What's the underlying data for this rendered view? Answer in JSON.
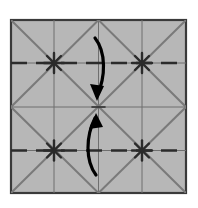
{
  "diagram": {
    "type": "origami-folding-instruction",
    "canvas": {
      "width": 198,
      "height": 208,
      "background_color": "#ffffff"
    },
    "paper": {
      "label": "square paper sheet",
      "fill_color": "#b7b7b7",
      "border_color": "#3a3a3a",
      "border_width": 2.2,
      "left": 11,
      "top": 20,
      "right": 186,
      "bottom": 193,
      "width": 175,
      "height": 173
    },
    "grid": {
      "label": "quarter grid lines",
      "color": "#6f6f6f",
      "width": 1,
      "vertical_x": [
        54,
        98.5,
        142
      ],
      "horizontal_y": [
        63,
        107,
        150.5
      ]
    },
    "creases": {
      "label": "diagonal crease lines",
      "color": "#7a7a7a",
      "width": 2,
      "segments": [
        {
          "name": "diag-tl-br-full",
          "x1": 11,
          "y1": 20,
          "x2": 186,
          "y2": 193
        },
        {
          "name": "diag-tr-bl-full",
          "x1": 186,
          "y1": 20,
          "x2": 11,
          "y2": 193
        },
        {
          "name": "diag-top-mid-left",
          "x1": 98.5,
          "y1": 20,
          "x2": 11,
          "y2": 107
        },
        {
          "name": "diag-top-mid-right",
          "x1": 98.5,
          "y1": 20,
          "x2": 186,
          "y2": 107
        },
        {
          "name": "diag-bottom-mid-left",
          "x1": 98.5,
          "y1": 193,
          "x2": 11,
          "y2": 107
        },
        {
          "name": "diag-bottom-mid-right",
          "x1": 98.5,
          "y1": 193,
          "x2": 186,
          "y2": 107
        }
      ]
    },
    "fold_lines": {
      "label": "valley fold dashed lines",
      "color": "#2b2b2b",
      "width": 2.6,
      "dash_pattern": "16 9",
      "lines": [
        {
          "name": "upper-fold-line",
          "y": 63,
          "x1": 11,
          "x2": 186
        },
        {
          "name": "lower-fold-line",
          "y": 150.5,
          "x1": 11,
          "x2": 186
        }
      ]
    },
    "stars": {
      "label": "crease intersection star points",
      "color": "#2b2b2b",
      "points": [
        {
          "name": "star-upper-left",
          "x": 54,
          "y": 63
        },
        {
          "name": "star-upper-right",
          "x": 142,
          "y": 63
        },
        {
          "name": "star-lower-left",
          "x": 54,
          "y": 150.5
        },
        {
          "name": "star-lower-right",
          "x": 142,
          "y": 150.5
        }
      ]
    },
    "arrows": [
      {
        "name": "fold-down-arrow",
        "direction": "down",
        "color": "#000000",
        "stroke_width": 3.2,
        "description": "Top edge folds down to center",
        "path": "M 95 38 C 106 52, 106 76, 97 96",
        "head_tip_x": 97,
        "head_tip_y": 101,
        "head_points": "97,101 90,84 104,86"
      },
      {
        "name": "fold-up-arrow",
        "direction": "up",
        "color": "#000000",
        "stroke_width": 3.2,
        "description": "Bottom edge folds up to center",
        "path": "M 96 175 C 85 160, 86 136, 95 118",
        "head_tip_x": 96,
        "head_tip_y": 113,
        "head_points": "96,113 89,129 103,127"
      }
    ],
    "center_point": {
      "name": "paper-center",
      "x": 98.5,
      "y": 107
    }
  }
}
